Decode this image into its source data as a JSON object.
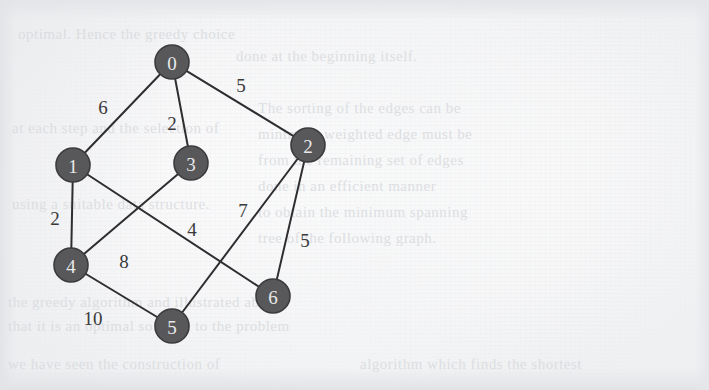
{
  "page": {
    "width": 709,
    "height": 390,
    "background_color": "#f6f6f7",
    "scan_artifact_color": "#d9dbdf"
  },
  "figure": {
    "kind": "undirected-weighted-graph",
    "node_fill": "#58585a",
    "node_stroke": "#3b3b3d",
    "node_text_color": "#e9e9ea",
    "edge_color": "#2e2e30",
    "weight_text_color": "#3a3a3c",
    "node_radius": 17
  },
  "chart_data": {
    "type": "diagram",
    "title": "",
    "nodes": [
      {
        "id": "0",
        "label": "0",
        "x": 172,
        "y": 62
      },
      {
        "id": "1",
        "label": "1",
        "x": 73,
        "y": 165
      },
      {
        "id": "3",
        "label": "3",
        "x": 191,
        "y": 163
      },
      {
        "id": "2",
        "label": "2",
        "x": 308,
        "y": 145
      },
      {
        "id": "4",
        "label": "4",
        "x": 71,
        "y": 265
      },
      {
        "id": "5",
        "label": "5",
        "x": 172,
        "y": 326
      },
      {
        "id": "6",
        "label": "6",
        "x": 273,
        "y": 296
      }
    ],
    "edges": [
      {
        "from": "0",
        "to": "1",
        "weight": 6,
        "label": "6",
        "lx": 103,
        "ly": 107
      },
      {
        "from": "0",
        "to": "3",
        "weight": 2,
        "label": "2",
        "lx": 172,
        "ly": 123
      },
      {
        "from": "0",
        "to": "2",
        "weight": 5,
        "label": "5",
        "lx": 241,
        "ly": 85
      },
      {
        "from": "1",
        "to": "4",
        "weight": 2,
        "label": "2",
        "lx": 55,
        "ly": 218
      },
      {
        "from": "1",
        "to": "6",
        "weight": 4,
        "label": "4",
        "lx": 192,
        "ly": 229
      },
      {
        "from": "3",
        "to": "4",
        "weight": 8,
        "label": "8",
        "lx": 124,
        "ly": 261
      },
      {
        "from": "2",
        "to": "5",
        "weight": 7,
        "label": "7",
        "lx": 243,
        "ly": 210
      },
      {
        "from": "2",
        "to": "6",
        "weight": 5,
        "label": "5",
        "lx": 305,
        "ly": 240
      },
      {
        "from": "4",
        "to": "5",
        "weight": 10,
        "label": "10",
        "lx": 93,
        "ly": 318
      }
    ]
  },
  "background_text": {
    "lines": [
      {
        "text": "optimal. Hence the greedy choice",
        "x": 18,
        "y": 26,
        "size": 15
      },
      {
        "text": "done at the beginning itself.",
        "x": 236,
        "y": 48,
        "size": 15
      },
      {
        "text": "The sorting of the edges can be",
        "x": 258,
        "y": 100,
        "size": 15
      },
      {
        "text": "at each step and the selection of",
        "x": 12,
        "y": 120,
        "size": 15
      },
      {
        "text": "minimum weighted edge must be",
        "x": 258,
        "y": 126,
        "size": 15
      },
      {
        "text": "from the remaining set of edges",
        "x": 258,
        "y": 152,
        "size": 15
      },
      {
        "text": "done in an efficient manner",
        "x": 258,
        "y": 178,
        "size": 15
      },
      {
        "text": "using a suitable data structure.",
        "x": 12,
        "y": 196,
        "size": 15
      },
      {
        "text": "to obtain the minimum spanning",
        "x": 258,
        "y": 204,
        "size": 15
      },
      {
        "text": "tree of the following graph.",
        "x": 258,
        "y": 230,
        "size": 15
      },
      {
        "text": "the greedy algorithm and illustrated above",
        "x": 8,
        "y": 294,
        "size": 15
      },
      {
        "text": "that it is an optimal solution to the problem",
        "x": 8,
        "y": 318,
        "size": 15
      },
      {
        "text": "we have seen the construction of",
        "x": 8,
        "y": 356,
        "size": 15
      },
      {
        "text": "algorithm which finds the shortest",
        "x": 360,
        "y": 356,
        "size": 15
      }
    ]
  }
}
